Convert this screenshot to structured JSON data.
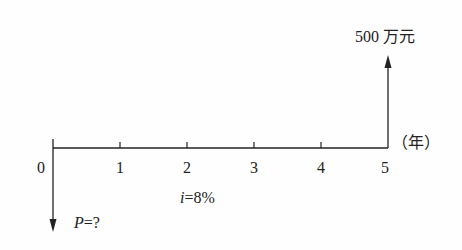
{
  "diagram": {
    "type": "cash-flow",
    "axis": {
      "period_labels": [
        "0",
        "1",
        "2",
        "3",
        "4",
        "5"
      ],
      "unit_label": "（年）"
    },
    "cash_flows": [
      {
        "period": 0,
        "direction": "down",
        "label_var": "P",
        "label_rest": "=?"
      },
      {
        "period": 5,
        "direction": "up",
        "label": "500 万元"
      }
    ],
    "rate": {
      "var": "i",
      "rest": "=8%"
    }
  }
}
